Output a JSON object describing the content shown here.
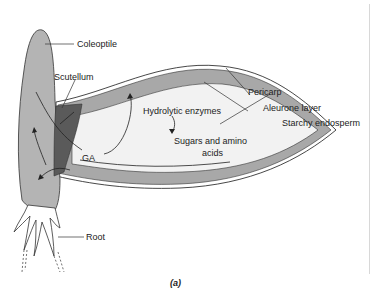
{
  "figure": {
    "caption": "(a)",
    "labels": {
      "coleoptile": "Coleoptile",
      "scutellum": "Scutellum",
      "ga": "GA",
      "pericarp": "Pericarp",
      "aleurone": "Aleurone layer",
      "endosperm": "Starchy endosperm",
      "hydrolytic": "Hydrolytic enzymes",
      "sugars_line1": "Sugars and amino",
      "sugars_line2": "acids",
      "root": "Root"
    },
    "colors": {
      "embryo": "#b4b4b4",
      "scutellum": "#5a5a5a",
      "aleurone": "#a8a8a8",
      "endosperm": "#f2f2f2",
      "outline": "#333333"
    }
  }
}
